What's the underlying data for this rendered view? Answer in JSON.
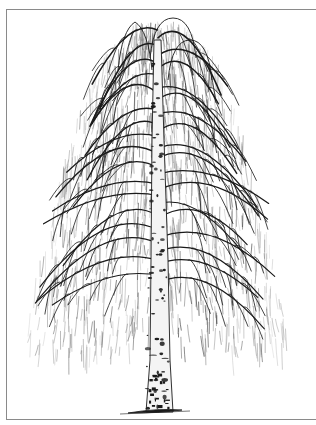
{
  "image": {
    "subject": "Weeping birch tree",
    "style": "pen-and-ink illustration",
    "alt": "Black-and-white ink drawing of a weeping silver birch with drooping branches and white bark trunk marked with black patches",
    "colors": {
      "background": "#ffffff",
      "ink": "#1a1a1a",
      "light_ink": "#6a6a6a",
      "frame": "#8a8a8a",
      "bark": "#f4f4f4"
    }
  }
}
